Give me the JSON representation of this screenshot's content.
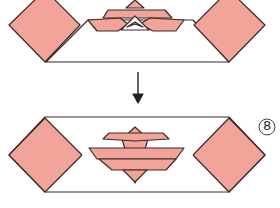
{
  "diagram": {
    "type": "origami-instruction",
    "colors": {
      "paper_colored": "#f2a49a",
      "paper_white": "#ffffff",
      "outline": "#3a2a26"
    },
    "steps": [
      {
        "number": "7",
        "label": "step-7-figure"
      },
      {
        "number": "8",
        "label": "step-8-figure"
      }
    ],
    "arrow": {
      "direction": "down"
    }
  }
}
